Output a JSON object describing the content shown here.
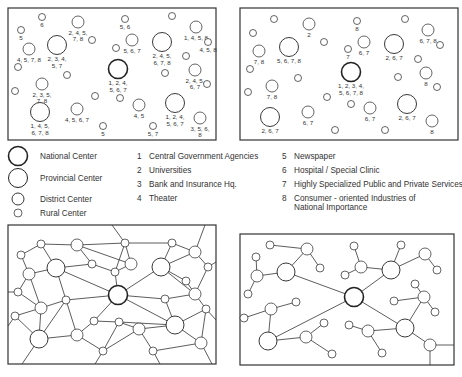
{
  "legend": {
    "sizes": [
      {
        "label": "National Center",
        "r": 9.5,
        "stroke": 1.6
      },
      {
        "label": "Provincial Center",
        "r": 9.5,
        "stroke": 1.0
      },
      {
        "label": "District Center",
        "r": 6,
        "stroke": 0.9
      },
      {
        "label": "Rural Center",
        "r": 4,
        "stroke": 0.7
      }
    ],
    "functions": [
      {
        "num": "1",
        "label": "Central Government  Agencies"
      },
      {
        "num": "2",
        "label": "Universities"
      },
      {
        "num": "3",
        "label": "Bank and Insurance Hq."
      },
      {
        "num": "4",
        "label": "Theater"
      },
      {
        "num": "5",
        "label": "Newspaper"
      },
      {
        "num": "6",
        "label": "Hospital / Special Clinic"
      },
      {
        "num": "7",
        "label": "Highly Specialized Public and Private Services"
      },
      {
        "num": "8",
        "label": "Consumer - oriented Industries of",
        "line2": "National Importance"
      }
    ]
  },
  "map_left": {
    "frame": [
      8,
      8,
      216,
      52
    ],
    "nodes": [
      {
        "x": 42,
        "y": 17,
        "r": 3.5,
        "label": [
          "6"
        ]
      },
      {
        "x": 21,
        "y": 30,
        "r": 3.5,
        "label": [
          "5"
        ]
      },
      {
        "x": 78,
        "y": 22,
        "r": 6,
        "label": [
          "2, 4, 5,",
          "7, 8"
        ]
      },
      {
        "x": 92,
        "y": 40,
        "r": 3.5
      },
      {
        "x": 29,
        "y": 49,
        "r": 6,
        "label": [
          "4, 5, 7, 8"
        ]
      },
      {
        "x": 57,
        "y": 45,
        "r": 9.5,
        "label": [
          "2, 3, 4,",
          "5, 7"
        ]
      },
      {
        "x": 18,
        "y": 67,
        "r": 3.5
      },
      {
        "x": 67,
        "y": 75,
        "r": 3.5
      },
      {
        "x": 125,
        "y": 19,
        "r": 3.5,
        "label": [
          "5, 6"
        ]
      },
      {
        "x": 116,
        "y": 48,
        "r": 3.5
      },
      {
        "x": 132,
        "y": 40,
        "r": 6,
        "label": [
          "5, 6, 7"
        ]
      },
      {
        "x": 118,
        "y": 69,
        "r": 9.5,
        "bold": true,
        "label": [
          "1, 2, 4,",
          "5, 6, 7"
        ]
      },
      {
        "x": 162,
        "y": 42,
        "r": 9.5,
        "label": [
          "2, 4, 5,",
          "6, 7, 8"
        ]
      },
      {
        "x": 172,
        "y": 16,
        "r": 3.5
      },
      {
        "x": 196,
        "y": 27,
        "r": 6,
        "label": [
          "1, 4, 5, 8"
        ]
      },
      {
        "x": 208,
        "y": 42,
        "r": 3.5,
        "label": [
          "4, 5, 8"
        ]
      },
      {
        "x": 186,
        "y": 56,
        "r": 3.5
      },
      {
        "x": 165,
        "y": 73,
        "r": 3.5
      },
      {
        "x": 195,
        "y": 70,
        "r": 6,
        "label": [
          "2, 4, 5,",
          "6, 7"
        ]
      },
      {
        "x": 207,
        "y": 84,
        "r": 3.5
      },
      {
        "x": 42,
        "y": 84,
        "r": 6,
        "label": [
          "2, 3, 5,",
          "7, 8"
        ]
      },
      {
        "x": 15,
        "y": 91,
        "r": 3.5
      },
      {
        "x": 95,
        "y": 96,
        "r": 3.5
      },
      {
        "x": 120,
        "y": 98,
        "r": 3.5
      },
      {
        "x": 40,
        "y": 112,
        "r": 9.5,
        "label": [
          "1, 4, 5,",
          "6, 7, 8"
        ]
      },
      {
        "x": 77,
        "y": 109,
        "r": 6,
        "label": [
          "4, 5, 6, 7"
        ]
      },
      {
        "x": 103,
        "y": 126,
        "r": 3.5,
        "label": [
          "5"
        ]
      },
      {
        "x": 139,
        "y": 105,
        "r": 6,
        "label": [
          "4, 5"
        ]
      },
      {
        "x": 175,
        "y": 103,
        "r": 9.5,
        "label": [
          "1, 2, 4,",
          "5, 6, 7"
        ]
      },
      {
        "x": 153,
        "y": 126,
        "r": 3.5,
        "label": [
          "5, 7"
        ]
      },
      {
        "x": 200,
        "y": 118,
        "r": 6,
        "label": [
          "3, 5, 6,",
          "8"
        ]
      }
    ]
  },
  "map_right": {
    "frame": [
      240,
      8,
      458,
      140
    ],
    "nodes": [
      {
        "x": 274,
        "y": 19,
        "r": 3.5
      },
      {
        "x": 253,
        "y": 33,
        "r": 3.5
      },
      {
        "x": 309,
        "y": 24,
        "r": 6,
        "label": [
          "2"
        ]
      },
      {
        "x": 324,
        "y": 42,
        "r": 3.5
      },
      {
        "x": 259,
        "y": 51,
        "r": 6,
        "label": [
          "7, 8"
        ]
      },
      {
        "x": 289,
        "y": 47,
        "r": 9.5,
        "label": [
          "5, 6, 7, 8"
        ]
      },
      {
        "x": 250,
        "y": 69,
        "r": 3.5
      },
      {
        "x": 298,
        "y": 78,
        "r": 3.5
      },
      {
        "x": 357,
        "y": 21,
        "r": 3.5,
        "label": [
          "8"
        ]
      },
      {
        "x": 348,
        "y": 49,
        "r": 3.5,
        "label": [
          "7"
        ]
      },
      {
        "x": 364,
        "y": 42,
        "r": 6,
        "label": [
          "6, 7"
        ]
      },
      {
        "x": 351,
        "y": 72,
        "r": 9.5,
        "bold": true,
        "label": [
          "1, 2, 3, 4,",
          "5, 6, 7, 8"
        ]
      },
      {
        "x": 394,
        "y": 44,
        "r": 9.5,
        "label": [
          "2, 6, 7"
        ]
      },
      {
        "x": 405,
        "y": 19,
        "r": 3.5
      },
      {
        "x": 428,
        "y": 30,
        "r": 6,
        "label": [
          "6, 7, 8"
        ]
      },
      {
        "x": 440,
        "y": 45,
        "r": 3.5
      },
      {
        "x": 418,
        "y": 59,
        "r": 3.5
      },
      {
        "x": 398,
        "y": 77,
        "r": 3.5
      },
      {
        "x": 426,
        "y": 73,
        "r": 6,
        "label": [
          "8"
        ]
      },
      {
        "x": 437,
        "y": 87,
        "r": 3.5
      },
      {
        "x": 272,
        "y": 86,
        "r": 6,
        "label": [
          "7, 8"
        ]
      },
      {
        "x": 248,
        "y": 92,
        "r": 3.5
      },
      {
        "x": 327,
        "y": 97,
        "r": 3.5
      },
      {
        "x": 351,
        "y": 104,
        "r": 3.5
      },
      {
        "x": 270,
        "y": 117,
        "r": 9.5,
        "label": [
          "2, 6, 7"
        ]
      },
      {
        "x": 308,
        "y": 112,
        "r": 6,
        "label": [
          "6, 7"
        ]
      },
      {
        "x": 335,
        "y": 130,
        "r": 3.5
      },
      {
        "x": 370,
        "y": 108,
        "r": 6,
        "label": [
          "6, 7"
        ]
      },
      {
        "x": 407,
        "y": 104,
        "r": 9.5,
        "label": [
          "2, 6, 7"
        ]
      },
      {
        "x": 385,
        "y": 130,
        "r": 3.5
      },
      {
        "x": 432,
        "y": 121,
        "r": 6,
        "label": [
          "8"
        ]
      }
    ]
  },
  "network_left": {
    "frame": [
      8,
      225,
      216,
      364
    ],
    "nodes": [
      {
        "x": 41,
        "y": 244,
        "r": 4
      },
      {
        "x": 21,
        "y": 255,
        "r": 4
      },
      {
        "x": 77,
        "y": 245,
        "r": 6
      },
      {
        "x": 125,
        "y": 243,
        "r": 4
      },
      {
        "x": 172,
        "y": 243,
        "r": 4
      },
      {
        "x": 195,
        "y": 252,
        "r": 6
      },
      {
        "x": 56,
        "y": 268,
        "r": 9
      },
      {
        "x": 29,
        "y": 274,
        "r": 6
      },
      {
        "x": 92,
        "y": 264,
        "r": 4
      },
      {
        "x": 131,
        "y": 264,
        "r": 6
      },
      {
        "x": 115,
        "y": 272,
        "r": 4
      },
      {
        "x": 161,
        "y": 267,
        "r": 9
      },
      {
        "x": 208,
        "y": 267,
        "r": 4
      },
      {
        "x": 186,
        "y": 281,
        "r": 4
      },
      {
        "x": 18,
        "y": 292,
        "r": 4
      },
      {
        "x": 118,
        "y": 295,
        "r": 9.5,
        "bold": true
      },
      {
        "x": 66,
        "y": 300,
        "r": 4
      },
      {
        "x": 195,
        "y": 294,
        "r": 6
      },
      {
        "x": 165,
        "y": 299,
        "r": 4
      },
      {
        "x": 41,
        "y": 308,
        "r": 6
      },
      {
        "x": 15,
        "y": 316,
        "r": 4
      },
      {
        "x": 206,
        "y": 309,
        "r": 4
      },
      {
        "x": 94,
        "y": 321,
        "r": 4
      },
      {
        "x": 119,
        "y": 322,
        "r": 4
      },
      {
        "x": 175,
        "y": 325,
        "r": 9
      },
      {
        "x": 139,
        "y": 329,
        "r": 6
      },
      {
        "x": 39,
        "y": 339,
        "r": 9
      },
      {
        "x": 77,
        "y": 335,
        "r": 6
      },
      {
        "x": 201,
        "y": 343,
        "r": 6
      },
      {
        "x": 103,
        "y": 351,
        "r": 4
      },
      {
        "x": 153,
        "y": 351,
        "r": 4
      }
    ],
    "edges": [
      [
        0,
        1
      ],
      [
        0,
        2
      ],
      [
        0,
        6
      ],
      [
        1,
        7
      ],
      [
        2,
        3
      ],
      [
        2,
        8
      ],
      [
        2,
        9
      ],
      [
        3,
        4
      ],
      [
        3,
        9
      ],
      [
        3,
        10
      ],
      [
        4,
        5
      ],
      [
        4,
        11
      ],
      [
        5,
        12
      ],
      [
        5,
        11
      ],
      [
        6,
        7
      ],
      [
        6,
        8
      ],
      [
        6,
        15
      ],
      [
        6,
        16
      ],
      [
        7,
        14
      ],
      [
        7,
        19
      ],
      [
        8,
        10
      ],
      [
        9,
        10
      ],
      [
        10,
        15
      ],
      [
        11,
        15
      ],
      [
        11,
        13
      ],
      [
        11,
        17
      ],
      [
        12,
        17
      ],
      [
        13,
        17
      ],
      [
        14,
        19
      ],
      [
        15,
        16
      ],
      [
        15,
        18
      ],
      [
        15,
        22
      ],
      [
        15,
        24
      ],
      [
        16,
        19
      ],
      [
        16,
        26
      ],
      [
        16,
        27
      ],
      [
        17,
        18
      ],
      [
        17,
        21
      ],
      [
        18,
        24
      ],
      [
        19,
        20
      ],
      [
        19,
        26
      ],
      [
        20,
        26
      ],
      [
        21,
        24
      ],
      [
        21,
        28
      ],
      [
        22,
        23
      ],
      [
        22,
        27
      ],
      [
        23,
        24
      ],
      [
        23,
        25
      ],
      [
        23,
        29
      ],
      [
        24,
        25
      ],
      [
        24,
        28
      ],
      [
        25,
        29
      ],
      [
        25,
        30
      ],
      [
        26,
        27
      ],
      [
        27,
        29
      ],
      [
        28,
        30
      ],
      [
        26,
        "b1"
      ],
      [
        29,
        "b2"
      ],
      [
        30,
        "b3"
      ],
      [
        28,
        "b4"
      ],
      [
        5,
        "t1"
      ],
      [
        3,
        "t2"
      ],
      [
        12,
        "r1"
      ],
      [
        21,
        "r2"
      ],
      [
        20,
        "l1"
      ],
      [
        14,
        "l2"
      ]
    ],
    "border_points": {
      "b1": [
        22,
        364
      ],
      "b2": [
        95,
        364
      ],
      "b3": [
        160,
        364
      ],
      "b4": [
        212,
        364
      ],
      "t1": [
        205,
        225
      ],
      "t2": [
        112,
        225
      ],
      "r1": [
        216,
        262
      ],
      "r2": [
        216,
        320
      ],
      "l1": [
        8,
        326
      ],
      "l2": [
        8,
        292
      ]
    }
  },
  "network_right": {
    "frame": [
      240,
      234,
      454,
      365
    ],
    "nodes": [
      {
        "x": 270,
        "y": 245,
        "r": 4
      },
      {
        "x": 307,
        "y": 249,
        "r": 6
      },
      {
        "x": 320,
        "y": 268,
        "r": 4
      },
      {
        "x": 256,
        "y": 257,
        "r": 4
      },
      {
        "x": 286,
        "y": 272,
        "r": 9
      },
      {
        "x": 257,
        "y": 276,
        "r": 6
      },
      {
        "x": 248,
        "y": 294,
        "r": 4
      },
      {
        "x": 354,
        "y": 246,
        "r": 4
      },
      {
        "x": 361,
        "y": 267,
        "r": 6
      },
      {
        "x": 345,
        "y": 275,
        "r": 4
      },
      {
        "x": 391,
        "y": 270,
        "r": 9
      },
      {
        "x": 401,
        "y": 245,
        "r": 4
      },
      {
        "x": 425,
        "y": 254,
        "r": 6
      },
      {
        "x": 437,
        "y": 270,
        "r": 4
      },
      {
        "x": 354,
        "y": 297,
        "r": 9.5,
        "bold": true
      },
      {
        "x": 415,
        "y": 284,
        "r": 4
      },
      {
        "x": 424,
        "y": 297,
        "r": 6
      },
      {
        "x": 394,
        "y": 301,
        "r": 4
      },
      {
        "x": 435,
        "y": 312,
        "r": 4
      },
      {
        "x": 271,
        "y": 309,
        "r": 6
      },
      {
        "x": 296,
        "y": 302,
        "r": 4
      },
      {
        "x": 244,
        "y": 318,
        "r": 4
      },
      {
        "x": 268,
        "y": 341,
        "r": 9
      },
      {
        "x": 306,
        "y": 337,
        "r": 6
      },
      {
        "x": 324,
        "y": 323,
        "r": 4
      },
      {
        "x": 332,
        "y": 354,
        "r": 4
      },
      {
        "x": 349,
        "y": 325,
        "r": 4
      },
      {
        "x": 368,
        "y": 331,
        "r": 6
      },
      {
        "x": 382,
        "y": 353,
        "r": 4
      },
      {
        "x": 405,
        "y": 328,
        "r": 9
      },
      {
        "x": 430,
        "y": 345,
        "r": 6
      }
    ],
    "edges": [
      [
        0,
        1
      ],
      [
        1,
        2
      ],
      [
        1,
        4
      ],
      [
        3,
        5
      ],
      [
        5,
        4
      ],
      [
        5,
        6
      ],
      [
        4,
        14
      ],
      [
        7,
        8
      ],
      [
        8,
        9
      ],
      [
        8,
        10
      ],
      [
        10,
        11
      ],
      [
        10,
        12
      ],
      [
        12,
        13
      ],
      [
        10,
        14
      ],
      [
        14,
        29
      ],
      [
        14,
        22
      ],
      [
        15,
        16
      ],
      [
        16,
        17
      ],
      [
        16,
        18
      ],
      [
        16,
        29
      ],
      [
        19,
        20
      ],
      [
        19,
        21
      ],
      [
        19,
        22
      ],
      [
        22,
        23
      ],
      [
        23,
        24
      ],
      [
        23,
        25
      ],
      [
        26,
        27
      ],
      [
        27,
        28
      ],
      [
        27,
        29
      ],
      [
        29,
        30
      ],
      [
        30,
        "r1"
      ],
      [
        30,
        "b1"
      ]
    ],
    "border_points": {
      "r1": [
        454,
        345
      ],
      "b1": [
        430,
        365
      ]
    }
  }
}
